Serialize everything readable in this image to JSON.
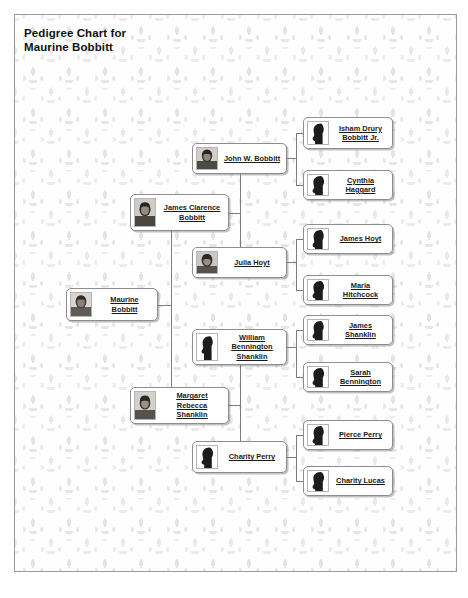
{
  "chart": {
    "title": "Pedigree Chart for Maurine Bobbitt",
    "title_line1": "Pedigree Chart for",
    "title_line2": "Maurine Bobbitt",
    "line_color": "#7d7d7d",
    "box_border_color": "#8e8e8e",
    "background_motif": "fleur-de-lis-watermark"
  },
  "people": {
    "subject": {
      "name": "Maurine Bobbitt",
      "portrait": "photo-portrait",
      "generation": 1
    },
    "father": {
      "name": "James Clarence Bobbitt",
      "name_line1": "James Clarence",
      "name_line2": "Bobbitt",
      "portrait": "photo-portrait",
      "generation": 2
    },
    "mother": {
      "name": "Margaret Rebecca Shanklin",
      "name_line1": "Margaret Rebecca",
      "name_line2": "Shanklin",
      "portrait": "photo-portrait",
      "generation": 2
    },
    "paternal_grandfather": {
      "name": "John W. Bobbitt",
      "portrait": "photo-portrait",
      "generation": 3
    },
    "paternal_grandmother": {
      "name": "Julia Hoyt",
      "portrait": "photo-portrait",
      "generation": 3
    },
    "maternal_grandfather": {
      "name": "William Bennington Shanklin",
      "name_line1": "William Bennington",
      "name_line2": "Shanklin",
      "portrait": "silhouette-male",
      "generation": 3
    },
    "maternal_grandmother": {
      "name": "Charity Perry",
      "portrait": "silhouette-female",
      "generation": 3
    },
    "ggf_1": {
      "name": "Isham Drury Bobbitt Jr.",
      "name_line1": "Isham Drury",
      "name_line2": "Bobbitt Jr.",
      "portrait": "silhouette-male",
      "generation": 4
    },
    "ggm_1": {
      "name": "Cynthia Haggard",
      "portrait": "silhouette-female",
      "generation": 4
    },
    "ggf_2": {
      "name": "James Hoyt",
      "portrait": "silhouette-male",
      "generation": 4
    },
    "ggm_2": {
      "name": "Maria Hitchcock",
      "portrait": "silhouette-female",
      "generation": 4
    },
    "ggf_3": {
      "name": "James Shanklin",
      "portrait": "silhouette-male",
      "generation": 4
    },
    "ggm_3": {
      "name": "Sarah Bennington",
      "portrait": "silhouette-female",
      "generation": 4
    },
    "ggf_4": {
      "name": "Pierce Perry",
      "portrait": "silhouette-male",
      "generation": 4
    },
    "ggm_4": {
      "name": "Charity Lucas",
      "portrait": "silhouette-female",
      "generation": 4
    }
  }
}
